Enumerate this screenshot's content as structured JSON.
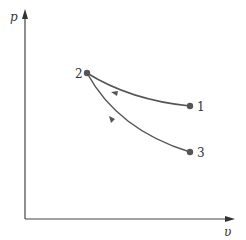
{
  "diagram": {
    "type": "p-v process diagram",
    "axes": {
      "y_label": "p",
      "x_label": "υ"
    },
    "points": [
      {
        "id": "1",
        "label": "1",
        "x": 190,
        "y": 106
      },
      {
        "id": "2",
        "label": "2",
        "x": 87,
        "y": 73
      },
      {
        "id": "3",
        "label": "3",
        "x": 190,
        "y": 152
      }
    ],
    "processes": [
      {
        "from": "1",
        "to": "2",
        "direction": "toward 2"
      },
      {
        "from": "3",
        "to": "2",
        "direction": "toward 2"
      }
    ],
    "colors": {
      "line": "#555555",
      "point": "#555555",
      "axis": "#444444"
    }
  }
}
